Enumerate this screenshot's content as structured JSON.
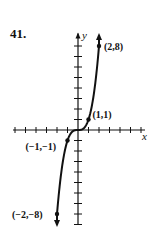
{
  "problem_number": "41.",
  "chart_data": {
    "type": "line",
    "title": "",
    "xlabel": "x",
    "ylabel": "y",
    "function": "y = x^3",
    "x": [
      -2,
      -1.5,
      -1,
      -0.5,
      0,
      0.5,
      1,
      1.5,
      2
    ],
    "y": [
      -8,
      -3.375,
      -1,
      -0.125,
      0,
      0.125,
      1,
      3.375,
      8
    ],
    "labeled_points": [
      {
        "x": -2,
        "y": -8,
        "label": "(−2,−8)"
      },
      {
        "x": -1,
        "y": -1,
        "label": "(−1,−1)"
      },
      {
        "x": 1,
        "y": 1,
        "label": "(1,1)"
      },
      {
        "x": 2,
        "y": 8,
        "label": "(2,8)"
      }
    ],
    "xlim": [
      -6,
      6
    ],
    "ylim": [
      -9,
      9
    ],
    "x_tick_step": 1,
    "y_tick_step": 1,
    "grid": false,
    "arrows_on_curve_ends": true
  }
}
